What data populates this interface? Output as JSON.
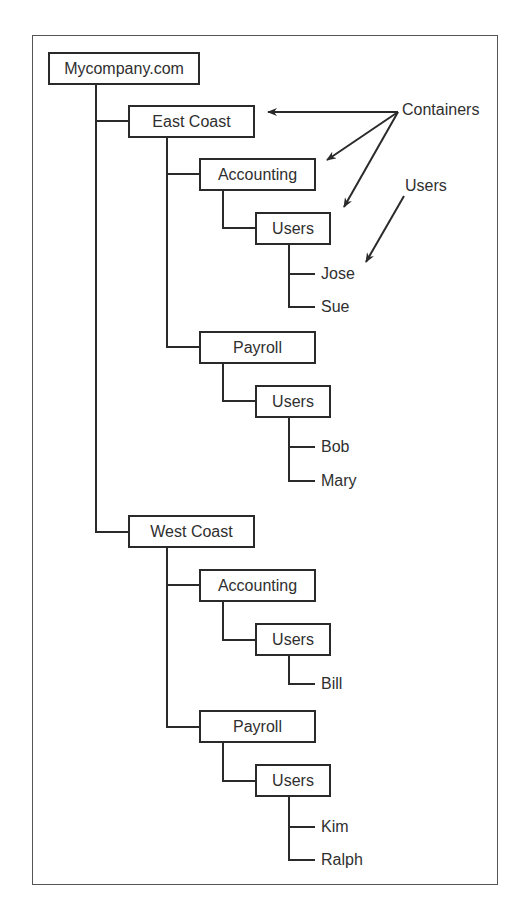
{
  "diagram": {
    "root": {
      "label": "Mycompany.com"
    },
    "east": {
      "label": "East Coast",
      "accounting": {
        "label": "Accounting",
        "users": {
          "label": "Users",
          "members": [
            "Jose",
            "Sue"
          ]
        }
      },
      "payroll": {
        "label": "Payroll",
        "users": {
          "label": "Users",
          "members": [
            "Bob",
            "Mary"
          ]
        }
      }
    },
    "west": {
      "label": "West Coast",
      "accounting": {
        "label": "Accounting",
        "users": {
          "label": "Users",
          "members": [
            "Bill"
          ]
        }
      },
      "payroll": {
        "label": "Payroll",
        "users": {
          "label": "Users",
          "members": [
            "Kim",
            "Ralph"
          ]
        }
      }
    },
    "annotations": {
      "containers": "Containers",
      "users": "Users"
    },
    "colors": {
      "line": "#2a2a2a",
      "frame": "#555555",
      "background": "#ffffff"
    }
  }
}
